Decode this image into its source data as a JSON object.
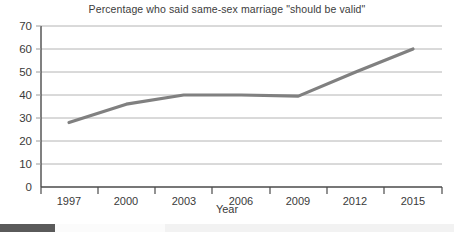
{
  "chart_data": {
    "type": "line",
    "title": "Percentage who said same-sex marriage \"should be valid\"",
    "xlabel": "Year",
    "ylabel": "",
    "categories": [
      "1997",
      "2000",
      "2003",
      "2006",
      "2009",
      "2012",
      "2015"
    ],
    "x": [
      1997,
      2000,
      2003,
      2006,
      2009,
      2012,
      2015
    ],
    "values": [
      28,
      36,
      40,
      40,
      39.5,
      50,
      60
    ],
    "series": [
      {
        "name": "Percentage who said same-sex marriage should be valid",
        "values": [
          28,
          36,
          40,
          40,
          39.5,
          50,
          60
        ]
      }
    ],
    "ylim": [
      0,
      70
    ],
    "yticks": [
      0,
      10,
      20,
      30,
      40,
      50,
      60,
      70
    ],
    "ytick_labels": [
      "0",
      "10",
      "20",
      "30",
      "40",
      "50",
      "60",
      "70"
    ],
    "xtick_labels": [
      "1997",
      "2000",
      "2003",
      "2006",
      "2009",
      "2012",
      "2015"
    ],
    "grid": true,
    "grid_axis": "y",
    "legend": false,
    "line_color": "#808080",
    "grid_color": "#b4b4b4",
    "axis_color": "#4a4a4a",
    "background_color": "#ffffff"
  },
  "figure": {
    "title": "Percentage who said same-sex marriage \"should be valid\"",
    "xaxis_title": "Year",
    "ytick_labels": [
      "70",
      "60",
      "50",
      "40",
      "30",
      "20",
      "10",
      "0"
    ],
    "xtick_labels": [
      "1997",
      "2000",
      "2003",
      "2006",
      "2009",
      "2012",
      "2015"
    ]
  },
  "bottom_bar": {
    "accent_color": "#5a5a5a",
    "strip_color": "#f2f2f2"
  }
}
